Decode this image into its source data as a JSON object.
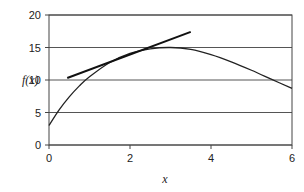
{
  "chart_data": {
    "type": "line",
    "title": "",
    "xlabel": "x",
    "ylabel": "f(x)",
    "xlim": [
      0,
      6
    ],
    "ylim": [
      0,
      20
    ],
    "x_ticks": [
      "0",
      "2",
      "4",
      "6"
    ],
    "y_ticks": [
      "0",
      "5",
      "10",
      "15",
      "20"
    ],
    "grid": {
      "horizontal": true,
      "vertical": false
    },
    "legend": "none",
    "series": [
      {
        "name": "f(x)",
        "style": "curve",
        "x": [
          0,
          0.25,
          0.5,
          0.75,
          1.0,
          1.5,
          2.0,
          2.5,
          3.0,
          3.5,
          4.0,
          4.5,
          5.0,
          5.5,
          6.0
        ],
        "values": [
          3.0,
          5.4,
          7.4,
          9.1,
          10.5,
          12.7,
          14.1,
          14.8,
          15.0,
          14.7,
          13.9,
          12.8,
          11.5,
          10.1,
          8.7
        ]
      },
      {
        "name": "tangent line",
        "style": "straight",
        "x": [
          0.45,
          3.5
        ],
        "values": [
          10.3,
          17.4
        ]
      }
    ]
  }
}
